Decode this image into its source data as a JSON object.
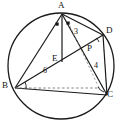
{
  "figure": {
    "kind": "circle-geometry-diagram",
    "stroke_color": "#1a1a1a",
    "dashed_color": "#6b6b6b",
    "background": "#ffffff",
    "points": [
      {
        "id": "A",
        "label": "A",
        "x": 62,
        "y": 14,
        "label_x": 58,
        "label_y": 1
      },
      {
        "id": "D",
        "label": "D",
        "x": 103,
        "y": 35,
        "label_x": 106,
        "label_y": 27
      },
      {
        "id": "C",
        "label": "C",
        "x": 107,
        "y": 95,
        "label_x": 108,
        "label_y": 92
      },
      {
        "id": "B",
        "label": "B",
        "x": 15,
        "y": 88,
        "label_x": 3,
        "label_y": 82
      },
      {
        "id": "P",
        "label": "P",
        "x": 88,
        "y": 56,
        "label_x": 88,
        "label_y": 45
      },
      {
        "id": "E",
        "label": "E",
        "x": 62,
        "y": 62,
        "label_x": 52,
        "label_y": 55
      }
    ],
    "measures": [
      {
        "id": "m3",
        "text": "3",
        "x": 75,
        "y": 30
      },
      {
        "id": "m4",
        "text": "4",
        "x": 95,
        "y": 64
      },
      {
        "id": "m6",
        "text": "6",
        "x": 44,
        "y": 69
      }
    ],
    "circle": {
      "cx": 61,
      "cy": 66,
      "r": 53
    },
    "segments": [
      {
        "id": "A-B",
        "from": "A",
        "to": "B",
        "style": "solid"
      },
      {
        "id": "A-C",
        "from": "A",
        "to": "C",
        "style": "solid"
      },
      {
        "id": "A-D",
        "from": "A",
        "to": "D",
        "style": "solid"
      },
      {
        "id": "A-E",
        "from": "A",
        "to": "E",
        "style": "solid"
      },
      {
        "id": "B-C",
        "from": "B",
        "to": "C",
        "style": "solid"
      },
      {
        "id": "B-D",
        "from": "B",
        "to": "D",
        "style": "solid"
      },
      {
        "id": "D-C",
        "from": "D",
        "to": "C",
        "style": "solid"
      },
      {
        "id": "B-P-dashed",
        "from": "B",
        "to": "P",
        "style": "dashed"
      }
    ],
    "angle_marks": [
      {
        "id": "angle-A-left",
        "kind": "square-dot",
        "x": 57,
        "y": 24
      },
      {
        "id": "angle-A-right",
        "kind": "square-dot",
        "x": 68,
        "y": 23
      },
      {
        "id": "angle-B",
        "kind": "arc",
        "x": 23,
        "y": 80
      },
      {
        "id": "angle-C",
        "kind": "arc",
        "x": 100,
        "y": 88
      },
      {
        "id": "angle-D",
        "kind": "arc",
        "x": 97,
        "y": 40
      }
    ]
  }
}
